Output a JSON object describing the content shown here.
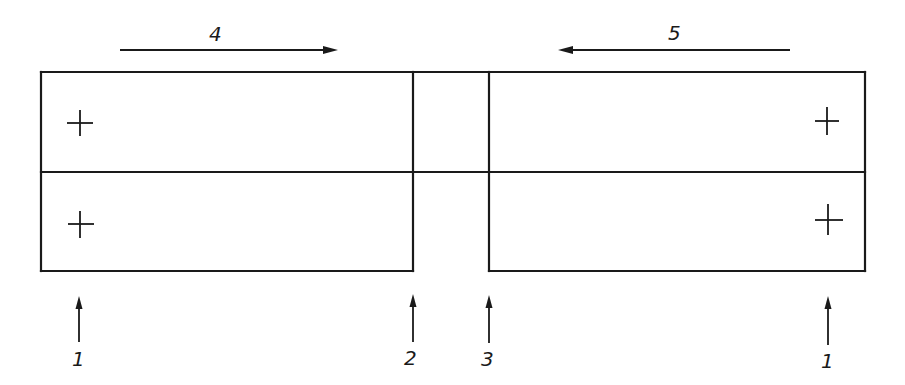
{
  "diagram": {
    "type": "technical-schematic",
    "top_arrows": [
      {
        "label": "4",
        "direction": "right",
        "x1": 120,
        "x2": 338,
        "y": 50
      },
      {
        "label": "5",
        "direction": "left",
        "x1": 560,
        "x2": 790,
        "y": 50
      }
    ],
    "bottom_arrows": [
      {
        "label": "1",
        "x": 79
      },
      {
        "label": "2",
        "x": 413
      },
      {
        "label": "3",
        "x": 489
      },
      {
        "label": "1",
        "x": 828
      }
    ],
    "blocks": {
      "left": {
        "x1": 41,
        "x2": 413
      },
      "right": {
        "x1": 489,
        "x2": 865
      },
      "top_y": 72,
      "mid_y": 172,
      "bottom_y": 271
    },
    "marks": [
      {
        "symbol": "+",
        "x": 79,
        "y": 123
      },
      {
        "symbol": "+",
        "x": 79,
        "y": 223
      },
      {
        "symbol": "+",
        "x": 827,
        "y": 121
      },
      {
        "symbol": "+",
        "x": 828,
        "y": 220
      }
    ]
  }
}
